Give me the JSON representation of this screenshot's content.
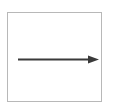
{
  "diagram": {
    "frame": {
      "border_color": "#b8b8b8"
    },
    "arrow": {
      "direction": "right",
      "color": "#3a3a3a",
      "x1": 18,
      "y1": 59,
      "x2": 99,
      "y2": 59
    }
  }
}
